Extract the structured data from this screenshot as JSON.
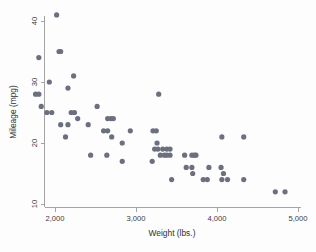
{
  "chart_data": {
    "type": "scatter",
    "title": "",
    "xlabel": "Weight (lbs.)",
    "ylabel": "Mileage (mpg)",
    "xlim": [
      1700,
      5050
    ],
    "ylim": [
      10,
      42
    ],
    "grid": false,
    "legend": null,
    "marker_color": "#6b6f7e",
    "marker_size": 2.6,
    "xticks": [
      2000,
      3000,
      4000,
      5000
    ],
    "xtick_labels": [
      "2,000",
      "3,000",
      "4,000",
      "5,000"
    ],
    "yticks": [
      10,
      20,
      30,
      40
    ],
    "ytick_labels": [
      "10",
      "20",
      "30",
      "40"
    ],
    "points": [
      {
        "x": 2020,
        "y": 41
      },
      {
        "x": 1800,
        "y": 34
      },
      {
        "x": 2050,
        "y": 35
      },
      {
        "x": 2070,
        "y": 35
      },
      {
        "x": 1930,
        "y": 30
      },
      {
        "x": 2230,
        "y": 31
      },
      {
        "x": 2160,
        "y": 29
      },
      {
        "x": 1760,
        "y": 28
      },
      {
        "x": 1800,
        "y": 28
      },
      {
        "x": 1830,
        "y": 26
      },
      {
        "x": 1900,
        "y": 25
      },
      {
        "x": 1960,
        "y": 25
      },
      {
        "x": 2200,
        "y": 25
      },
      {
        "x": 2240,
        "y": 25
      },
      {
        "x": 2280,
        "y": 24
      },
      {
        "x": 2070,
        "y": 23
      },
      {
        "x": 2160,
        "y": 23
      },
      {
        "x": 2410,
        "y": 23
      },
      {
        "x": 2130,
        "y": 21
      },
      {
        "x": 2520,
        "y": 26
      },
      {
        "x": 2650,
        "y": 24
      },
      {
        "x": 2690,
        "y": 24
      },
      {
        "x": 2720,
        "y": 24
      },
      {
        "x": 2600,
        "y": 22
      },
      {
        "x": 2650,
        "y": 22
      },
      {
        "x": 2700,
        "y": 21
      },
      {
        "x": 2830,
        "y": 20
      },
      {
        "x": 2930,
        "y": 22
      },
      {
        "x": 2440,
        "y": 18
      },
      {
        "x": 2640,
        "y": 18
      },
      {
        "x": 2830,
        "y": 17
      },
      {
        "x": 3280,
        "y": 28
      },
      {
        "x": 3210,
        "y": 22
      },
      {
        "x": 3250,
        "y": 22
      },
      {
        "x": 3260,
        "y": 20
      },
      {
        "x": 3270,
        "y": 19
      },
      {
        "x": 3230,
        "y": 19
      },
      {
        "x": 3200,
        "y": 17
      },
      {
        "x": 3330,
        "y": 19
      },
      {
        "x": 3380,
        "y": 19
      },
      {
        "x": 3420,
        "y": 19
      },
      {
        "x": 3300,
        "y": 18
      },
      {
        "x": 3350,
        "y": 18
      },
      {
        "x": 3380,
        "y": 18
      },
      {
        "x": 3420,
        "y": 18
      },
      {
        "x": 3440,
        "y": 14
      },
      {
        "x": 3600,
        "y": 18
      },
      {
        "x": 3690,
        "y": 18
      },
      {
        "x": 3720,
        "y": 18
      },
      {
        "x": 3740,
        "y": 18
      },
      {
        "x": 3620,
        "y": 16
      },
      {
        "x": 3690,
        "y": 16
      },
      {
        "x": 3700,
        "y": 15
      },
      {
        "x": 3830,
        "y": 14
      },
      {
        "x": 3880,
        "y": 14
      },
      {
        "x": 3900,
        "y": 16
      },
      {
        "x": 4050,
        "y": 16
      },
      {
        "x": 4080,
        "y": 15
      },
      {
        "x": 4060,
        "y": 21
      },
      {
        "x": 4330,
        "y": 21
      },
      {
        "x": 4060,
        "y": 14
      },
      {
        "x": 4130,
        "y": 14
      },
      {
        "x": 4330,
        "y": 14
      },
      {
        "x": 4720,
        "y": 12
      },
      {
        "x": 4840,
        "y": 12
      }
    ]
  }
}
